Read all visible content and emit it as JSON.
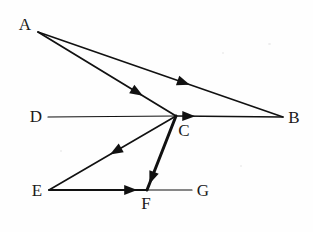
{
  "figure": {
    "type": "directed-graph",
    "title": "",
    "background_color": "#fefefe",
    "ink_color": "#111111",
    "width": 313,
    "height": 232
  },
  "nodes": [
    {
      "id": "A",
      "label": "A",
      "label_x": 25,
      "label_y": 24,
      "point_x": 38,
      "point_y": 32
    },
    {
      "id": "B",
      "label": "B",
      "label_x": 294,
      "label_y": 117,
      "point_x": 283,
      "point_y": 117
    },
    {
      "id": "C",
      "label": "C",
      "label_x": 184,
      "label_y": 130,
      "point_x": 176,
      "point_y": 116
    },
    {
      "id": "D",
      "label": "D",
      "label_x": 36,
      "label_y": 116,
      "point_x": 48,
      "point_y": 117
    },
    {
      "id": "E",
      "label": "E",
      "label_x": 37,
      "label_y": 190,
      "point_x": 49,
      "point_y": 190
    },
    {
      "id": "F",
      "label": "F",
      "label_x": 146,
      "label_y": 203,
      "point_x": 147,
      "point_y": 190
    },
    {
      "id": "G",
      "label": "G",
      "label_x": 203,
      "label_y": 190,
      "point_x": 192,
      "point_y": 190
    }
  ],
  "edges": [
    {
      "id": "A-B",
      "from": "A",
      "to": "B",
      "directed": true,
      "arrow_at": "mid",
      "arrow_t": 0.62,
      "width": 1.6,
      "label": ""
    },
    {
      "id": "A-C",
      "from": "A",
      "to": "C",
      "directed": true,
      "arrow_at": "mid",
      "arrow_t": 0.76,
      "width": 1.8,
      "label": ""
    },
    {
      "id": "D-C",
      "from": "D",
      "to": "C",
      "directed": false,
      "arrow_at": "none",
      "arrow_t": 0,
      "width": 1.2,
      "label": ""
    },
    {
      "id": "C-B",
      "from": "C",
      "to": "B",
      "directed": true,
      "arrow_at": "start",
      "arrow_t": 0.18,
      "width": 1.4,
      "label": ""
    },
    {
      "id": "C-E",
      "from": "C",
      "to": "E",
      "directed": true,
      "arrow_at": "mid",
      "arrow_t": 0.52,
      "width": 1.6,
      "label": ""
    },
    {
      "id": "C-F",
      "from": "C",
      "to": "F",
      "directed": true,
      "arrow_at": "end",
      "arrow_t": 0.92,
      "width": 3.0,
      "label": ""
    },
    {
      "id": "E-F",
      "from": "E",
      "to": "F",
      "directed": true,
      "arrow_at": "end",
      "arrow_t": 0.9,
      "width": 2.0,
      "label": ""
    },
    {
      "id": "F-G",
      "from": "F",
      "to": "G",
      "directed": false,
      "arrow_at": "none",
      "arrow_t": 0,
      "width": 1.2,
      "label": ""
    }
  ],
  "arrow_geometry": {
    "length": 13,
    "half_width": 5
  }
}
